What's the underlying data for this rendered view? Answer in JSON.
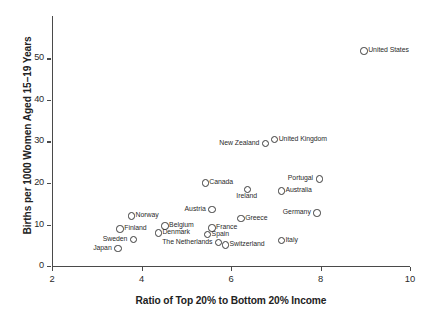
{
  "chart_data": {
    "type": "scatter",
    "title": "",
    "xlabel": "Ratio of Top 20% to Bottom 20% Income",
    "ylabel": "Births per 1000 Women Aged 15–19 Years",
    "xlim": [
      2,
      10
    ],
    "ylim": [
      0,
      57
    ],
    "xticks": [
      2,
      4,
      6,
      8,
      10
    ],
    "xtick_labels": [
      "2",
      "4",
      "6",
      "8",
      "10"
    ],
    "yticks": [
      0,
      10,
      20,
      30,
      40,
      50
    ],
    "ytick_labels": [
      "0",
      "10",
      "20",
      "30",
      "40",
      "50"
    ],
    "grid": false,
    "legend": "none",
    "points": [
      {
        "label": "United States",
        "x": 8.95,
        "y": 52.0,
        "pos": "right"
      },
      {
        "label": "United Kingdom",
        "x": 6.95,
        "y": 30.7,
        "pos": "right"
      },
      {
        "label": "New Zealand",
        "x": 6.75,
        "y": 29.8,
        "pos": "left"
      },
      {
        "label": "Portugal",
        "x": 7.95,
        "y": 21.2,
        "pos": "left"
      },
      {
        "label": "Canada",
        "x": 5.4,
        "y": 20.2,
        "pos": "right"
      },
      {
        "label": "Ireland",
        "x": 6.35,
        "y": 18.7,
        "pos": "below"
      },
      {
        "label": "Australia",
        "x": 7.1,
        "y": 18.3,
        "pos": "right"
      },
      {
        "label": "Austria",
        "x": 5.55,
        "y": 13.9,
        "pos": "left"
      },
      {
        "label": "Germany",
        "x": 7.9,
        "y": 13.0,
        "pos": "left"
      },
      {
        "label": "Norway",
        "x": 3.75,
        "y": 12.3,
        "pos": "right"
      },
      {
        "label": "Greece",
        "x": 6.2,
        "y": 11.7,
        "pos": "right"
      },
      {
        "label": "Belgium",
        "x": 4.5,
        "y": 9.9,
        "pos": "right"
      },
      {
        "label": "France",
        "x": 5.55,
        "y": 9.4,
        "pos": "right"
      },
      {
        "label": "Finland",
        "x": 3.5,
        "y": 9.2,
        "pos": "right"
      },
      {
        "label": "Denmark",
        "x": 4.35,
        "y": 8.2,
        "pos": "right"
      },
      {
        "label": "Spain",
        "x": 5.45,
        "y": 7.9,
        "pos": "right"
      },
      {
        "label": "Sweden",
        "x": 3.8,
        "y": 6.6,
        "pos": "left"
      },
      {
        "label": "Italy",
        "x": 7.1,
        "y": 6.4,
        "pos": "right"
      },
      {
        "label": "The Netherlands",
        "x": 5.7,
        "y": 5.9,
        "pos": "left"
      },
      {
        "label": "Switzerland",
        "x": 5.85,
        "y": 5.3,
        "pos": "right"
      },
      {
        "label": "Japan",
        "x": 3.45,
        "y": 4.5,
        "pos": "left"
      }
    ]
  }
}
